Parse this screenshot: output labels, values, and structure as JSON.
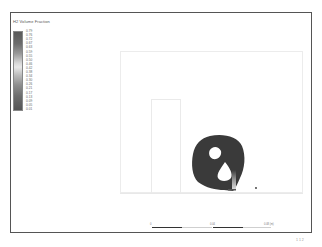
{
  "figure": {
    "type": "contour-plot",
    "colors": {
      "frame": "#555555",
      "plume": "#3a3a3a",
      "domain_outline": "#ececec",
      "background": "#ffffff"
    }
  },
  "legend": {
    "title": "H2 Volume Fraction",
    "ticks": [
      "0.79",
      "0.76",
      "0.72",
      "0.67",
      "0.63",
      "0.59",
      "0.55",
      "0.50",
      "0.46",
      "0.42",
      "0.38",
      "0.34",
      "0.30",
      "0.26",
      "0.21",
      "0.17",
      "0.13",
      "0.09",
      "0.05",
      "0.01"
    ]
  },
  "scale_bar": {
    "labels": [
      "0",
      "0.04",
      "0.08 (m)"
    ]
  },
  "footer": {
    "page_number": "1 1 2"
  }
}
